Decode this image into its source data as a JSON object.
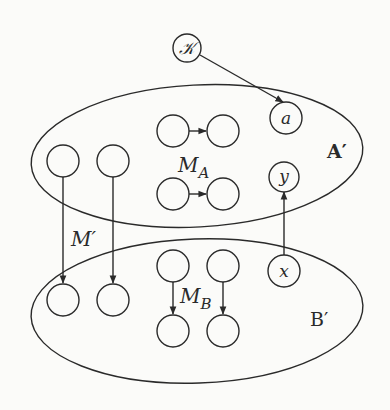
{
  "diagram": {
    "sets": {
      "A": {
        "label": "A′"
      },
      "B": {
        "label": "B′"
      }
    },
    "nodes": {
      "K": {
        "label": "𝒦"
      },
      "a": {
        "label": "a"
      },
      "y": {
        "label": "y"
      },
      "x": {
        "label": "x"
      }
    },
    "labels": {
      "M_A": {
        "main": "M",
        "sub": "A"
      },
      "M_B": {
        "main": "M",
        "sub": "B"
      },
      "M_prime": {
        "main": "M′"
      }
    },
    "edges": [
      {
        "from": "K",
        "to": "a"
      },
      {
        "from": "x",
        "to": "y"
      },
      {
        "from": "A-left-1",
        "to": "B-left-1",
        "label": "M′"
      },
      {
        "from": "A-left-2",
        "to": "B-left-2",
        "label": "M′"
      },
      {
        "from": "MA-top-1",
        "to": "MA-top-2",
        "label": "M_A"
      },
      {
        "from": "MA-bot-1",
        "to": "MA-bot-2",
        "label": "M_A"
      },
      {
        "from": "MB-top-1",
        "to": "MB-bot-1",
        "label": "M_B"
      },
      {
        "from": "MB-top-2",
        "to": "MB-bot-2",
        "label": "M_B"
      }
    ],
    "colors": {
      "ink": "#2a2a2a",
      "paper": "#fbfbf9"
    }
  }
}
